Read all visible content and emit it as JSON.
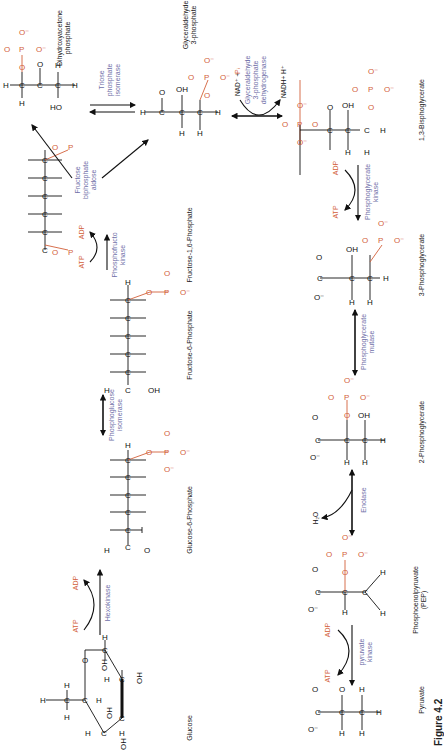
{
  "figure": {
    "caption": "Figure 4.2",
    "orientation": "rotated 90 degrees clockwise",
    "colors": {
      "structure": "#111111",
      "phosphate_and_cofactors": "#d2603a",
      "enzymes": "#6f6fa8"
    }
  },
  "molecules": [
    {
      "id": "glucose",
      "name": "Glucose"
    },
    {
      "id": "g6p",
      "name": "Glucose-6-Phosphate"
    },
    {
      "id": "f6p",
      "name": "Fructose-6-Phosphate"
    },
    {
      "id": "f16bp",
      "name": "Fructose-1,6-Phosphate"
    },
    {
      "id": "dhap",
      "name_line1": "Dihydroxyacetone",
      "name_line2": "phosphate"
    },
    {
      "id": "g3p",
      "name_line1": "Glyceraldehyde",
      "name_line2": "3-phosphate"
    },
    {
      "id": "bpg",
      "name": "1,3-Bisphoglycerate"
    },
    {
      "id": "pg3",
      "name": "3-Phosphoglycerate"
    },
    {
      "id": "pg2",
      "name": "2-Phosphoglycerate"
    },
    {
      "id": "pep",
      "name_line1": "Phosphoenolpyruvate",
      "name_line2": "(PEP)"
    },
    {
      "id": "pyruvate",
      "name": "Pyruvate"
    }
  ],
  "reactions": [
    {
      "id": "r1",
      "enzyme": "Hexokinase",
      "in": "ATP",
      "out": "ADP",
      "direction": "forward"
    },
    {
      "id": "r2",
      "enzyme_line1": "Phosphoglucose",
      "enzyme_line2": "isomerase",
      "direction": "reversible"
    },
    {
      "id": "r3",
      "enzyme_line1": "Phosphofructo",
      "enzyme_line2": "kinase",
      "in": "ATP",
      "out": "ADP",
      "direction": "forward"
    },
    {
      "id": "r4",
      "enzyme_line1": "Fructose",
      "enzyme_line2": "biphosphate",
      "enzyme_line3": "aldose",
      "direction": "split"
    },
    {
      "id": "r5",
      "enzyme_line1": "Triose",
      "enzyme_line2": "phosphate",
      "enzyme_line3": "isomerase",
      "direction": "reversible"
    },
    {
      "id": "r6",
      "enzyme_line1": "Glyceraldehyde",
      "enzyme_line2": "3-phosphate",
      "enzyme_line3": "dehydrogenase",
      "in_line": "NAD⁺ + Pᵢ",
      "in_nad": "NAD⁺ +",
      "in_pi": "Pᵢ",
      "out": "NADH+ H⁺",
      "direction": "reversible"
    },
    {
      "id": "r7",
      "enzyme_line1": "Phosphoglycerate",
      "enzyme_line2": "kinase",
      "in": "ADP",
      "out": "ATP",
      "direction": "forward"
    },
    {
      "id": "r8",
      "enzyme_line1": "Phosphoglycerate",
      "enzyme_line2": "mutase",
      "direction": "reversible"
    },
    {
      "id": "r9",
      "enzyme": "Enolase",
      "out": "H₂O",
      "direction": "reversible"
    },
    {
      "id": "r10",
      "enzyme_line1": "pyruvate",
      "enzyme_line2": "kinase",
      "in": "ADP",
      "out": "ATP",
      "direction": "forward"
    }
  ],
  "atoms": {
    "C": "C",
    "H": "H",
    "O": "O",
    "OH": "OH",
    "HO": "HO",
    "P": "P",
    "Ominus": "O⁻"
  }
}
